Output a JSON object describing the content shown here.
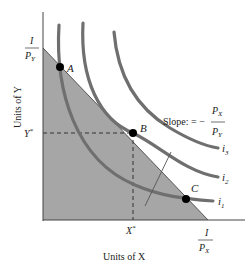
{
  "diagram": {
    "type": "consumer-choice-indifference-curves",
    "colors": {
      "feasible_region": "#a6a6a6",
      "curves": "#6f6f6f",
      "axes": "#444444",
      "points": "#000000",
      "text": "#222222"
    },
    "axes": {
      "x_label": "Units of X",
      "y_label": "Units of Y"
    },
    "intercepts": {
      "y_intercept": {
        "numerator": "I",
        "denominator": "P",
        "denominator_sub": "Y"
      },
      "x_intercept": {
        "numerator": "I",
        "denominator": "P",
        "denominator_sub": "X"
      }
    },
    "optimum": {
      "x_star": "X",
      "y_star": "Y",
      "star": "*"
    },
    "points": [
      {
        "label": "A"
      },
      {
        "label": "B"
      },
      {
        "label": "C"
      }
    ],
    "indifference_curves": [
      {
        "label": "i",
        "sub": "1"
      },
      {
        "label": "i",
        "sub": "2"
      },
      {
        "label": "i",
        "sub": "3"
      }
    ],
    "slope_annotation": {
      "prefix": "Slope: = −",
      "numerator": "P",
      "numerator_sub": "X",
      "denominator": "P",
      "denominator_sub": "Y"
    }
  }
}
